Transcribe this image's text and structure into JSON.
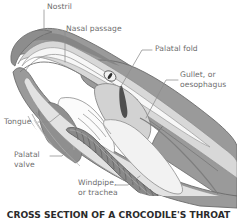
{
  "figure": {
    "caption": "CROSS SECTION OF A CROCODILE'S THROAT",
    "background_color": "#ffffff",
    "label_color": "#6e6e6e",
    "caption_color": "#2b2b2b",
    "leader_line_color": "#8c8c8c",
    "outline_color": "#6b6b6b"
  },
  "palette": {
    "skin_mid_grey": "#9a9a9a",
    "skin_dark_grey": "#828282",
    "tissue_light": "#d8d8d8",
    "tissue_pale": "#ececec",
    "cavity_white": "#fbfbfb",
    "tongue_dark": "#8f8f8f",
    "trachea_grey": "#8a8a8a",
    "trachea_ring": "#6d6d6d",
    "eye_white": "#f2f2f2",
    "pupil_black": "#2e2e2e"
  },
  "labels": [
    {
      "id": "nostril",
      "text": "Nostril",
      "line2": "",
      "x": 47,
      "y": 2
    },
    {
      "id": "nasal",
      "text": "Nasal passage",
      "line2": "",
      "x": 66,
      "y": 24
    },
    {
      "id": "palatal_fold",
      "text": "Palatal fold",
      "line2": "",
      "x": 155,
      "y": 47
    },
    {
      "id": "gullet",
      "text": "Gullet, or",
      "line2": "oesophagus",
      "x": 180,
      "y": 73
    },
    {
      "id": "tongue",
      "text": "Tongue",
      "line2": "",
      "x": 4,
      "y": 119
    },
    {
      "id": "palatal_valve",
      "text": "Palatal",
      "line2": "valve",
      "x": 14,
      "y": 152
    },
    {
      "id": "windpipe",
      "text": "Windpipe,",
      "line2": "or trachea",
      "x": 78,
      "y": 180
    }
  ]
}
